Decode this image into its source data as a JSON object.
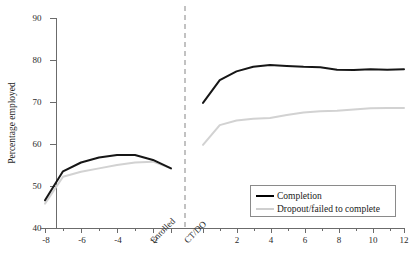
{
  "chart_data": {
    "type": "line",
    "title": "",
    "xlabel": "",
    "ylabel": "Percentage employed",
    "ylim": [
      40,
      90
    ],
    "yticks": [
      40,
      50,
      60,
      70,
      80,
      90
    ],
    "xticks_left": [
      "-8",
      "-6",
      "-4",
      "-2",
      "Enrolled"
    ],
    "xticks_right": [
      "CT/DO",
      "2",
      "4",
      "6",
      "8",
      "10",
      "12"
    ],
    "grid": false,
    "legend_position": "bottom-right",
    "annotations": [
      "dashed vertical divider between pre-period (Enrolled) and post-period (CT/DO)"
    ],
    "series": [
      {
        "name": "Completion",
        "color": "#161616",
        "pre": {
          "x": [
            -8,
            -7,
            -6,
            -5,
            -4,
            -3,
            -2,
            -1
          ],
          "y": [
            46.6,
            53.5,
            55.6,
            56.8,
            57.4,
            57.4,
            56.2,
            54.2
          ]
        },
        "post": {
          "x": [
            0,
            1,
            2,
            3,
            4,
            5,
            6,
            7,
            8,
            9,
            10,
            11,
            12
          ],
          "y": [
            69.8,
            75.2,
            77.3,
            78.4,
            78.8,
            78.6,
            78.4,
            78.3,
            77.7,
            77.6,
            77.8,
            77.7,
            77.8
          ]
        }
      },
      {
        "name": "Dropout/failed to complete",
        "color": "#d2d2d2",
        "pre": {
          "x": [
            -8,
            -7,
            -6,
            -5,
            -4,
            -3,
            -2,
            -1
          ],
          "y": [
            45.8,
            52.2,
            53.4,
            54.2,
            55.0,
            55.6,
            55.8,
            54.2
          ]
        },
        "post": {
          "x": [
            0,
            1,
            2,
            3,
            4,
            5,
            6,
            7,
            8,
            9,
            10,
            11,
            12
          ],
          "y": [
            59.8,
            64.5,
            65.6,
            66.0,
            66.2,
            66.9,
            67.5,
            67.8,
            67.9,
            68.2,
            68.5,
            68.6,
            68.6
          ]
        }
      }
    ]
  },
  "axis": {
    "y_ticks": [
      {
        "label": "90"
      },
      {
        "label": "80"
      },
      {
        "label": "70"
      },
      {
        "label": "60"
      },
      {
        "label": "50"
      },
      {
        "label": "40"
      }
    ],
    "y_title": "Percentage employed",
    "x_ticks": [
      {
        "label": "-8"
      },
      {
        "label": "-6"
      },
      {
        "label": "-4"
      },
      {
        "label": "-2"
      },
      {
        "label": "Enrolled"
      },
      {
        "label": "CT/DO"
      },
      {
        "label": "2"
      },
      {
        "label": "4"
      },
      {
        "label": "6"
      },
      {
        "label": "8"
      },
      {
        "label": "10"
      },
      {
        "label": "12"
      }
    ]
  },
  "legend": {
    "entries": [
      {
        "label": "Completion"
      },
      {
        "label": "Dropout/failed to complete"
      }
    ]
  },
  "colors": {
    "completion": "#161616",
    "dropout": "#d2d2d2",
    "axis": "#6b6b6b",
    "divider": "#9a9a9a"
  }
}
